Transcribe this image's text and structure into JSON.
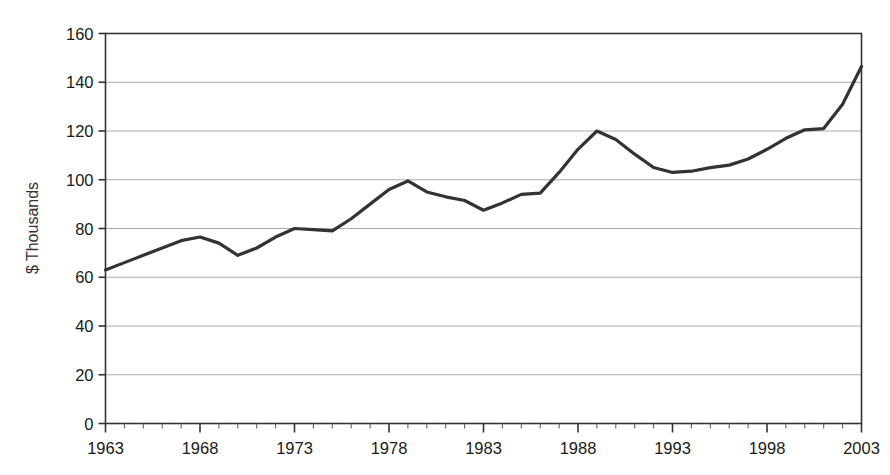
{
  "chart_data": {
    "type": "line",
    "title": "",
    "subtitle": "",
    "xlabel": "",
    "ylabel": "$ Thousands",
    "xlim": [
      1963,
      2003
    ],
    "ylim": [
      0,
      160
    ],
    "grid": true,
    "grid_axis": "y",
    "legend": false,
    "legend_position": "none",
    "line_color": "#333333",
    "x_tick_labels": [
      "1963",
      "1968",
      "1973",
      "1978",
      "1983",
      "1988",
      "1993",
      "1998",
      "2003"
    ],
    "x_tick_values": [
      1963,
      1968,
      1973,
      1978,
      1983,
      1988,
      1993,
      1998,
      2003
    ],
    "x_minor_tick_interval": 1,
    "y_tick_labels": [
      "0",
      "20",
      "40",
      "60",
      "80",
      "100",
      "120",
      "140",
      "160"
    ],
    "y_tick_values": [
      0,
      20,
      40,
      60,
      80,
      100,
      120,
      140,
      160
    ],
    "x": [
      1963,
      1964,
      1965,
      1966,
      1967,
      1968,
      1969,
      1970,
      1971,
      1972,
      1973,
      1974,
      1975,
      1976,
      1977,
      1978,
      1979,
      1980,
      1981,
      1982,
      1983,
      1984,
      1985,
      1986,
      1987,
      1988,
      1989,
      1990,
      1991,
      1992,
      1993,
      1994,
      1995,
      1996,
      1997,
      1998,
      1999,
      2000,
      2001,
      2002,
      2003
    ],
    "series": [
      {
        "name": "Median home value",
        "values": [
          63.0,
          66.0,
          69.0,
          72.0,
          75.0,
          76.5,
          74.0,
          69.0,
          72.0,
          76.5,
          80.0,
          79.5,
          79.0,
          84.0,
          90.0,
          96.0,
          99.5,
          95.0,
          93.0,
          91.5,
          87.5,
          90.5,
          94.0,
          94.5,
          103.0,
          112.5,
          120.0,
          116.5,
          110.5,
          105.0,
          103.0,
          103.5,
          105.0,
          106.0,
          108.5,
          112.5,
          117.0,
          120.5,
          121.0,
          131.0,
          146.5
        ]
      }
    ]
  },
  "axis": {
    "y_axis_title": "$ Thousands"
  }
}
